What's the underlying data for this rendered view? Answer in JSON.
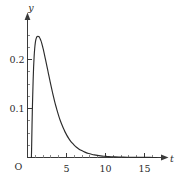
{
  "figure": {
    "background_color": "#ffffff",
    "ink_color": "#2b2b2b",
    "origin_label": "O"
  },
  "chart_data": {
    "type": "line",
    "title": "",
    "subtitle": "",
    "xlabel": "t",
    "ylabel": "y",
    "xlim": [
      0,
      16.6
    ],
    "ylim": [
      0,
      0.285
    ],
    "grid": false,
    "legend": null,
    "legend_position": "none",
    "x_ticks_major": [
      5,
      10,
      15
    ],
    "x_tick_labels": [
      "5",
      "10",
      "15"
    ],
    "x_ticks_minor": [
      1,
      2,
      3,
      4,
      6,
      7,
      8,
      9,
      11,
      12,
      13,
      14,
      16
    ],
    "y_ticks_major": [
      0.1,
      0.2
    ],
    "y_tick_labels": [
      "0.1",
      "0.2"
    ],
    "y_ticks_minor": [
      0.025,
      0.05,
      0.075,
      0.125,
      0.15,
      0.175,
      0.225,
      0.25
    ],
    "annotations": [],
    "series": [
      {
        "name": "density",
        "color": "#2b2b2b",
        "peak_x": 1.55,
        "peak_y": 0.2475,
        "x": [
          0.5,
          0.52,
          0.55,
          0.6,
          0.66,
          0.72,
          0.78,
          0.85,
          0.92,
          1.0,
          1.08,
          1.16,
          1.25,
          1.34,
          1.43,
          1.52,
          1.62,
          1.72,
          1.82,
          1.92,
          2.03,
          2.14,
          2.26,
          2.38,
          2.5,
          2.63,
          2.76,
          2.9,
          3.04,
          3.19,
          3.34,
          3.5,
          3.67,
          3.84,
          4.02,
          4.2,
          4.4,
          4.6,
          4.81,
          5.03,
          5.26,
          5.5,
          5.75,
          6.01,
          6.28,
          6.57,
          6.87,
          7.18,
          7.5,
          7.84,
          8.2,
          8.57,
          8.96,
          9.37,
          9.8,
          10.25,
          10.72,
          11.21,
          11.73,
          12.27,
          12.84,
          13.44,
          14.07,
          14.73,
          15.42,
          16.14,
          16.6
        ],
        "y": [
          0.0,
          0.014,
          0.039,
          0.081,
          0.122,
          0.156,
          0.183,
          0.206,
          0.222,
          0.234,
          0.241,
          0.245,
          0.247,
          0.2475,
          0.247,
          0.2455,
          0.2425,
          0.2385,
          0.2335,
          0.2275,
          0.2205,
          0.2125,
          0.2035,
          0.1945,
          0.1855,
          0.1755,
          0.1655,
          0.155,
          0.1445,
          0.134,
          0.1235,
          0.113,
          0.103,
          0.0935,
          0.084,
          0.0755,
          0.0672,
          0.0595,
          0.0523,
          0.0457,
          0.0396,
          0.0341,
          0.0292,
          0.0248,
          0.0209,
          0.0175,
          0.0146,
          0.0121,
          0.0099,
          0.0081,
          0.0066,
          0.0053,
          0.0042,
          0.0033,
          0.0026,
          0.0021,
          0.0016,
          0.0013,
          0.001,
          0.0008,
          0.0006,
          0.0004,
          0.0003,
          0.0002,
          0.0002,
          0.0001,
          0.0001
        ]
      }
    ]
  }
}
